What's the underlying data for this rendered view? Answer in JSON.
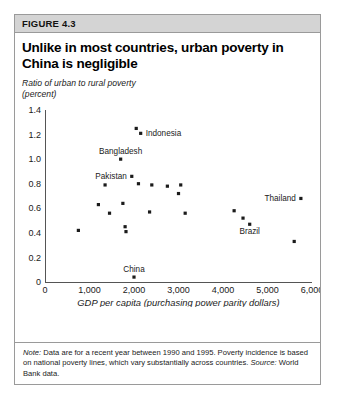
{
  "figure": {
    "number": "FIGURE 4.3",
    "title": "Unlike in most countries, urban poverty in China is negligible",
    "unit_label_line1": "Ratio of urban to rural poverty",
    "unit_label_line2": "(percent)",
    "note_lead": "Note:",
    "note_text": " Data are for a recent year between 1990 and 1995. Poverty incidence is based on national poverty lines, which vary substantially across countries.",
    "source_lead": "Source:",
    "source_text": " World Bank data."
  },
  "colors": {
    "marker": "#1b1b1b",
    "axis": "#555555",
    "header_bg": "#d4d4d4",
    "border": "#9a9a9a"
  },
  "chart_data": {
    "type": "scatter",
    "title": "Unlike in most countries, urban poverty in China is negligible",
    "xlabel": "GDP per capita (purchasing power parity dollars)",
    "ylabel": "Ratio of urban to rural poverty (percent)",
    "xlim": [
      0,
      6000
    ],
    "ylim": [
      0,
      1.4
    ],
    "xticks": [
      0,
      1000,
      2000,
      3000,
      4000,
      5000,
      6000
    ],
    "xticklabels": [
      "0",
      "1,000",
      "2,000",
      "3,000",
      "4,000",
      "5,000",
      "6,000"
    ],
    "yticks": [
      0,
      0.2,
      0.4,
      0.6,
      0.8,
      1.0,
      1.2,
      1.4
    ],
    "yticklabels": [
      "0",
      "0.2",
      "0.4",
      "0.6",
      "0.8",
      "1.0",
      "1.2",
      "1.4"
    ],
    "grid": false,
    "legend": false,
    "points": [
      {
        "x": 750,
        "y": 0.42,
        "label": ""
      },
      {
        "x": 1200,
        "y": 0.63,
        "label": ""
      },
      {
        "x": 1350,
        "y": 0.79,
        "label": ""
      },
      {
        "x": 1450,
        "y": 0.56,
        "label": ""
      },
      {
        "x": 1700,
        "y": 1.0,
        "label": "Bangladesh",
        "label_pos": "top"
      },
      {
        "x": 1750,
        "y": 0.64,
        "label": ""
      },
      {
        "x": 1800,
        "y": 0.45,
        "label": ""
      },
      {
        "x": 1820,
        "y": 0.41,
        "label": ""
      },
      {
        "x": 1950,
        "y": 0.86,
        "label": "Pakistan",
        "label_pos": "left"
      },
      {
        "x": 2000,
        "y": 0.04,
        "label": "China",
        "label_pos": "top"
      },
      {
        "x": 2050,
        "y": 1.25,
        "label": ""
      },
      {
        "x": 2100,
        "y": 0.8,
        "label": ""
      },
      {
        "x": 2150,
        "y": 1.21,
        "label": "Indonesia",
        "label_pos": "right"
      },
      {
        "x": 2350,
        "y": 0.57,
        "label": ""
      },
      {
        "x": 2400,
        "y": 0.79,
        "label": ""
      },
      {
        "x": 2750,
        "y": 0.78,
        "label": ""
      },
      {
        "x": 3000,
        "y": 0.72,
        "label": ""
      },
      {
        "x": 3050,
        "y": 0.79,
        "label": ""
      },
      {
        "x": 3150,
        "y": 0.56,
        "label": ""
      },
      {
        "x": 4250,
        "y": 0.58,
        "label": ""
      },
      {
        "x": 4450,
        "y": 0.52,
        "label": ""
      },
      {
        "x": 4600,
        "y": 0.47,
        "label": "Brazil",
        "label_pos": "bottom"
      },
      {
        "x": 5750,
        "y": 0.68,
        "label": "Thailand",
        "label_pos": "left"
      },
      {
        "x": 5600,
        "y": 0.33,
        "label": ""
      }
    ]
  }
}
